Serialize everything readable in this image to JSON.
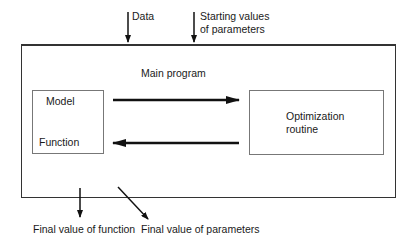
{
  "inputs": {
    "data": "Data",
    "starting_values_line1": "Starting values",
    "starting_values_line2": "of parameters"
  },
  "main": {
    "title": "Main program",
    "model_box": {
      "line1": "Model",
      "line2": "Function"
    },
    "optimization_box": {
      "line1": "Optimization",
      "line2": "routine"
    }
  },
  "outputs": {
    "final_function": "Final value of function",
    "final_parameters": "Final value of parameters"
  }
}
